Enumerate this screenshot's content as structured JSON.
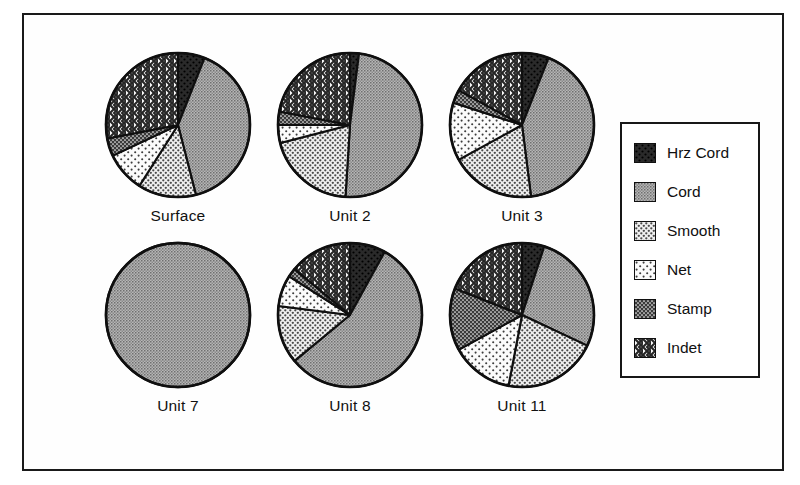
{
  "figure": {
    "frame_color": "#1a1a1a",
    "background": "#ffffff"
  },
  "legend": {
    "title": "",
    "position": "right",
    "entries": [
      {
        "label": "Hrz Cord",
        "pattern": "solid-black",
        "swatch_name": "swatch-hrz-cord"
      },
      {
        "label": "Cord",
        "pattern": "medium-gray-stipple",
        "swatch_name": "swatch-cord"
      },
      {
        "label": "Smooth",
        "pattern": "light-dots",
        "swatch_name": "swatch-smooth"
      },
      {
        "label": "Net",
        "pattern": "sparse-dots",
        "swatch_name": "swatch-net"
      },
      {
        "label": "Stamp",
        "pattern": "dense-dark-dots",
        "swatch_name": "swatch-stamp"
      },
      {
        "label": "Indet",
        "pattern": "crosshatch",
        "swatch_name": "swatch-indet"
      }
    ]
  },
  "chart_data": {
    "type": "pie",
    "title": "",
    "subtitle": "",
    "xlabel": "",
    "ylabel": "",
    "grid": false,
    "legend_position": "right",
    "categories": [
      "Hrz Cord",
      "Cord",
      "Smooth",
      "Net",
      "Stamp",
      "Indet"
    ],
    "category_patterns": [
      "solid-black",
      "medium-gray-stipple",
      "light-dots",
      "sparse-dots",
      "dense-dark-dots",
      "crosshatch"
    ],
    "unit": "percent",
    "charts": [
      {
        "title": "Surface",
        "values": [
          6,
          40,
          13,
          9,
          4,
          28
        ],
        "start_angle": 0,
        "direction": "clockwise"
      },
      {
        "title": "Unit 2",
        "values": [
          2,
          49,
          20,
          4,
          3,
          22
        ],
        "start_angle": 0,
        "direction": "clockwise"
      },
      {
        "title": "Unit 3",
        "values": [
          6,
          42,
          19,
          13,
          3,
          17
        ],
        "start_angle": 0,
        "direction": "clockwise"
      },
      {
        "title": "Unit 7",
        "values": [
          0,
          100,
          0,
          0,
          0,
          0
        ],
        "start_angle": 0,
        "direction": "clockwise"
      },
      {
        "title": "Unit 8",
        "values": [
          8,
          56,
          13,
          7,
          2,
          14
        ],
        "start_angle": 0,
        "direction": "clockwise"
      },
      {
        "title": "Unit 11",
        "values": [
          5,
          27,
          21,
          14,
          14,
          19
        ],
        "start_angle": 0,
        "direction": "clockwise"
      }
    ]
  },
  "layout": {
    "pie_positions": [
      {
        "left": 74,
        "top": 34
      },
      {
        "left": 246,
        "top": 34
      },
      {
        "left": 418,
        "top": 34
      },
      {
        "left": 74,
        "top": 224
      },
      {
        "left": 246,
        "top": 224
      },
      {
        "left": 418,
        "top": 224
      }
    ]
  }
}
